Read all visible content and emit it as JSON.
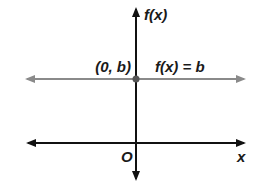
{
  "diagram": {
    "colors": {
      "axis": "#111111",
      "function_line": "#8a8a8a",
      "point": "#555555",
      "background": "#ffffff"
    },
    "axes": {
      "x_label": "x",
      "y_label": "f(x)",
      "origin_label": "O"
    },
    "function": {
      "label": "f(x) = b",
      "type": "horizontal-line"
    },
    "point": {
      "label": "(0, b)"
    }
  }
}
